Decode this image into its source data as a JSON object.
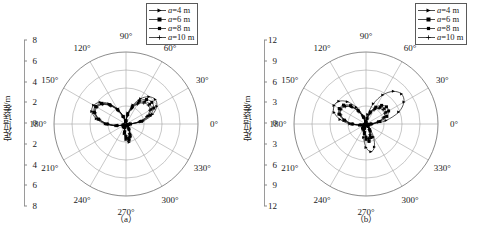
{
  "chart_data": [
    {
      "type": "line",
      "panel": "(a)",
      "title": "",
      "subtitle": "",
      "projection": "polar",
      "ylabel": "定位误差/m",
      "xlabel": "",
      "grid": true,
      "legend_position": "top-right",
      "rlim": [
        0,
        8
      ],
      "r_ticks": [
        2,
        4,
        6,
        8
      ],
      "y_axis_ticks": [
        "8",
        "6",
        "4",
        "2",
        "0",
        "2",
        "4",
        "6",
        "8"
      ],
      "theta_ticks": [
        "0°",
        "30°",
        "60°",
        "90°",
        "120°",
        "150°",
        "180°",
        "210°",
        "240°",
        "270°",
        "300°",
        "330°"
      ],
      "theta_step_deg": 30,
      "series": [
        {
          "name": "a=4 m",
          "marker": "triangle-right",
          "theta": [
            0,
            10,
            20,
            30,
            40,
            50,
            60,
            70,
            80,
            90,
            100,
            110,
            120,
            130,
            140,
            150,
            160,
            170,
            180,
            190,
            200,
            210,
            220,
            230,
            240,
            250,
            260,
            270,
            280,
            290,
            300,
            310,
            320,
            330,
            340,
            350
          ],
          "values": [
            0.55,
            1.95,
            3.15,
            3.95,
            4.25,
            3.95,
            3.25,
            2.25,
            1.25,
            0.45,
            0.3,
            0.95,
            1.95,
            2.95,
            3.75,
            4.15,
            4.05,
            3.35,
            2.3,
            1.15,
            0.35,
            0.25,
            0.4,
            0.45,
            0.4,
            0.45,
            1.1,
            1.75,
            2.05,
            1.55,
            0.75,
            0.3,
            0.2,
            0.2,
            0.25,
            0.3
          ]
        },
        {
          "name": "a=6 m",
          "marker": "square",
          "theta": [
            0,
            10,
            20,
            30,
            40,
            50,
            60,
            70,
            80,
            90,
            100,
            110,
            120,
            130,
            140,
            150,
            160,
            170,
            180,
            190,
            200,
            210,
            220,
            230,
            240,
            250,
            260,
            270,
            280,
            290,
            300,
            310,
            320,
            330,
            340,
            350
          ],
          "values": [
            0.5,
            1.75,
            2.85,
            3.55,
            3.75,
            3.55,
            2.95,
            2.05,
            1.1,
            0.4,
            0.28,
            0.9,
            1.85,
            2.8,
            3.55,
            3.9,
            3.8,
            3.15,
            2.15,
            1.05,
            0.32,
            0.22,
            0.35,
            0.4,
            0.35,
            0.4,
            0.95,
            1.55,
            1.8,
            1.35,
            0.65,
            0.28,
            0.18,
            0.18,
            0.22,
            0.28
          ]
        },
        {
          "name": "a=8 m",
          "marker": "square-small",
          "theta": [
            0,
            10,
            20,
            30,
            40,
            50,
            60,
            70,
            80,
            90,
            100,
            110,
            120,
            130,
            140,
            150,
            160,
            170,
            180,
            190,
            200,
            210,
            220,
            230,
            240,
            250,
            260,
            270,
            280,
            290,
            300,
            310,
            320,
            330,
            340,
            350
          ],
          "values": [
            0.45,
            1.6,
            2.6,
            3.25,
            3.45,
            3.25,
            2.7,
            1.9,
            1.0,
            0.35,
            0.25,
            0.85,
            1.75,
            2.7,
            3.45,
            3.8,
            3.7,
            3.05,
            2.05,
            0.98,
            0.3,
            0.2,
            0.32,
            0.36,
            0.32,
            0.36,
            0.85,
            1.4,
            1.65,
            1.2,
            0.58,
            0.25,
            0.16,
            0.16,
            0.2,
            0.25
          ]
        },
        {
          "name": "a=10 m",
          "marker": "plus",
          "theta": [
            0,
            10,
            20,
            30,
            40,
            50,
            60,
            70,
            80,
            90,
            100,
            110,
            120,
            130,
            140,
            150,
            160,
            170,
            180,
            190,
            200,
            210,
            220,
            230,
            240,
            250,
            260,
            270,
            280,
            290,
            300,
            310,
            320,
            330,
            340,
            350
          ],
          "values": [
            0.42,
            1.5,
            2.45,
            3.05,
            3.25,
            3.05,
            2.55,
            1.8,
            0.95,
            0.33,
            0.24,
            0.82,
            1.7,
            2.62,
            3.38,
            3.72,
            3.62,
            2.98,
            2.0,
            0.94,
            0.28,
            0.19,
            0.3,
            0.34,
            0.3,
            0.34,
            0.8,
            1.3,
            1.55,
            1.12,
            0.54,
            0.24,
            0.15,
            0.15,
            0.19,
            0.24
          ]
        }
      ]
    },
    {
      "type": "line",
      "panel": "(b)",
      "title": "",
      "subtitle": "",
      "projection": "polar",
      "ylabel": "定位误差/m",
      "xlabel": "",
      "grid": true,
      "legend_position": "top-right",
      "rlim": [
        0,
        12
      ],
      "r_ticks": [
        3,
        6,
        9,
        12
      ],
      "y_axis_ticks": [
        "12",
        "9",
        "6",
        "3",
        "0",
        "3",
        "6",
        "9",
        "12"
      ],
      "theta_ticks": [
        "0°",
        "30°",
        "60°",
        "90°",
        "120°",
        "150°",
        "180°",
        "210°",
        "240°",
        "270°",
        "300°",
        "330°"
      ],
      "theta_step_deg": 30,
      "series": [
        {
          "name": "a=4 m",
          "marker": "triangle-right",
          "theta": [
            0,
            10,
            20,
            30,
            40,
            50,
            60,
            70,
            80,
            90,
            100,
            110,
            120,
            130,
            140,
            150,
            160,
            170,
            180,
            190,
            200,
            210,
            220,
            230,
            240,
            250,
            260,
            270,
            280,
            290,
            300,
            310,
            320,
            330,
            340,
            350
          ],
          "values": [
            1.1,
            3.4,
            5.8,
            7.3,
            7.75,
            7.1,
            5.6,
            3.6,
            1.6,
            0.5,
            0.45,
            1.55,
            3.2,
            4.85,
            5.9,
            6.15,
            5.65,
            4.4,
            2.7,
            1.1,
            0.4,
            0.35,
            0.6,
            0.9,
            1.0,
            1.1,
            2.3,
            3.9,
            4.7,
            4.1,
            2.5,
            1.0,
            0.45,
            0.35,
            0.45,
            0.6
          ]
        },
        {
          "name": "a=6 m",
          "marker": "square",
          "theta": [
            0,
            10,
            20,
            30,
            40,
            50,
            60,
            70,
            80,
            90,
            100,
            110,
            120,
            130,
            140,
            150,
            160,
            170,
            180,
            190,
            200,
            210,
            220,
            230,
            240,
            250,
            260,
            270,
            280,
            290,
            300,
            310,
            320,
            330,
            340,
            350
          ],
          "values": [
            0.85,
            2.35,
            3.7,
            4.35,
            4.45,
            4.05,
            3.25,
            2.15,
            1.0,
            0.38,
            0.35,
            1.25,
            2.65,
            4.0,
            4.9,
            5.15,
            4.8,
            3.75,
            2.35,
            0.95,
            0.35,
            0.28,
            0.45,
            0.65,
            0.72,
            0.8,
            1.6,
            2.55,
            2.95,
            2.4,
            1.35,
            0.55,
            0.3,
            0.26,
            0.32,
            0.45
          ]
        },
        {
          "name": "a=8 m",
          "marker": "square-small",
          "theta": [
            0,
            10,
            20,
            30,
            40,
            50,
            60,
            70,
            80,
            90,
            100,
            110,
            120,
            130,
            140,
            150,
            160,
            170,
            180,
            190,
            200,
            210,
            220,
            230,
            240,
            250,
            260,
            270,
            280,
            290,
            300,
            310,
            320,
            330,
            340,
            350
          ],
          "values": [
            0.78,
            2.1,
            3.3,
            3.9,
            4.0,
            3.65,
            2.95,
            1.95,
            0.92,
            0.34,
            0.32,
            1.15,
            2.45,
            3.75,
            4.65,
            4.95,
            4.6,
            3.6,
            2.25,
            0.9,
            0.32,
            0.25,
            0.4,
            0.58,
            0.64,
            0.7,
            1.4,
            2.2,
            2.55,
            2.05,
            1.15,
            0.48,
            0.27,
            0.23,
            0.29,
            0.4
          ]
        },
        {
          "name": "a=10 m",
          "marker": "plus",
          "theta": [
            0,
            10,
            20,
            30,
            40,
            50,
            60,
            70,
            80,
            90,
            100,
            110,
            120,
            130,
            140,
            150,
            160,
            170,
            180,
            190,
            200,
            210,
            220,
            230,
            240,
            250,
            260,
            270,
            280,
            290,
            300,
            310,
            320,
            330,
            340,
            350
          ],
          "values": [
            0.72,
            1.95,
            3.05,
            3.6,
            3.7,
            3.38,
            2.72,
            1.8,
            0.86,
            0.32,
            0.3,
            1.1,
            2.35,
            3.62,
            4.5,
            4.82,
            4.48,
            3.5,
            2.18,
            0.86,
            0.3,
            0.23,
            0.37,
            0.54,
            0.6,
            0.65,
            1.3,
            2.05,
            2.38,
            1.9,
            1.06,
            0.44,
            0.25,
            0.21,
            0.27,
            0.37
          ]
        }
      ]
    }
  ],
  "panels": [
    {
      "id": "a",
      "caption": "（a）",
      "ylabel": "定位误差/m",
      "y_ticks": [
        "8",
        "6",
        "4",
        "2",
        "0",
        "2",
        "4",
        "6",
        "8"
      ],
      "angles": [
        "0°",
        "30°",
        "60°",
        "90°",
        "120°",
        "150°",
        "180°",
        "210°",
        "240°",
        "270°",
        "300°",
        "330°"
      ],
      "legend": [
        {
          "label_var": "a",
          "label_rest": "=4 m",
          "marker": "triangle-right"
        },
        {
          "label_var": "a",
          "label_rest": "=6 m",
          "marker": "square"
        },
        {
          "label_var": "a",
          "label_rest": "=8 m",
          "marker": "square-small"
        },
        {
          "label_var": "a",
          "label_rest": "=10 m",
          "marker": "plus"
        }
      ]
    },
    {
      "id": "b",
      "caption": "（b）",
      "ylabel": "定位误差/m",
      "y_ticks": [
        "12",
        "9",
        "6",
        "3",
        "0",
        "3",
        "6",
        "9",
        "12"
      ],
      "angles": [
        "0°",
        "30°",
        "60°",
        "90°",
        "120°",
        "150°",
        "180°",
        "210°",
        "240°",
        "270°",
        "300°",
        "330°"
      ],
      "legend": [
        {
          "label_var": "a",
          "label_rest": "=4 m",
          "marker": "triangle-right"
        },
        {
          "label_var": "a",
          "label_rest": "=6 m",
          "marker": "square"
        },
        {
          "label_var": "a",
          "label_rest": "=8 m",
          "marker": "square-small"
        },
        {
          "label_var": "a",
          "label_rest": "=10 m",
          "marker": "plus"
        }
      ]
    }
  ],
  "colors": {
    "line": "#000000",
    "grid": "#9b9b9b",
    "axis": "#8a8a8a",
    "text": "#1a1a1a",
    "background": "#ffffff"
  }
}
